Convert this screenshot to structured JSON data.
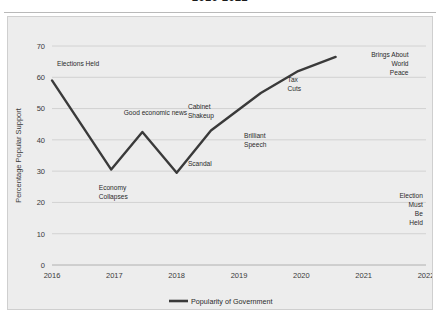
{
  "chart_title": "2016-2022",
  "chart_data": {
    "type": "line",
    "title": "2016-2022",
    "xlabel": "",
    "ylabel": "Percentage Popular Support",
    "xlim": [
      2016,
      2022
    ],
    "ylim": [
      0,
      70
    ],
    "ytick_step": 10,
    "grid": true,
    "legend_position": "bottom",
    "xtick_labels": [
      "2016",
      "2017",
      "2018",
      "2019",
      "2020",
      "2021",
      "2022"
    ],
    "ytick_labels": [
      "0",
      "10",
      "20",
      "30",
      "40",
      "50",
      "60",
      "70"
    ],
    "series": [
      {
        "name": "Popularity of Government",
        "color": "#3a3a3a",
        "x": [
          2016.0,
          2016.95,
          2017.45,
          2018.0,
          2018.55,
          2019.35,
          2019.95,
          2020.55
        ],
        "values": [
          59.0,
          30.5,
          42.5,
          29.5,
          43.0,
          55.0,
          62.0,
          66.5
        ]
      }
    ],
    "annotations": [
      {
        "text": "Elections Held",
        "lines": [
          "Elections Held"
        ],
        "x": 2016.08,
        "y": 63.5,
        "align": "start"
      },
      {
        "text": "Economy Collapses",
        "lines": [
          "Economy",
          "Collapses"
        ],
        "x": 2016.75,
        "y": 24.0,
        "align": "start"
      },
      {
        "text": "Good economic news",
        "lines": [
          "Good economic news"
        ],
        "x": 2017.15,
        "y": 48.0,
        "align": "start"
      },
      {
        "text": "Cabinet Shakeup",
        "lines": [
          "Cabinet",
          "Shakeup"
        ],
        "x": 2018.18,
        "y": 50.0,
        "align": "start"
      },
      {
        "text": "Scandal",
        "lines": [
          "Scandal"
        ],
        "x": 2018.18,
        "y": 31.5,
        "align": "start"
      },
      {
        "text": "Brilliant Speech",
        "lines": [
          "Brilliant",
          "Speech"
        ],
        "x": 2019.08,
        "y": 40.5,
        "align": "start"
      },
      {
        "text": "Tax Cuts",
        "lines": [
          "Tax",
          "Cuts"
        ],
        "x": 2019.78,
        "y": 58.5,
        "align": "start"
      },
      {
        "text": "Brings About World Peace",
        "lines": [
          "Brings About",
          "World",
          "Peace"
        ],
        "x": 2021.72,
        "y": 66.5,
        "align": "end"
      },
      {
        "text": "Election Must Be Held",
        "lines": [
          "Election",
          "Must",
          "Be",
          "Held"
        ],
        "x": 2021.95,
        "y": 21.5,
        "align": "end"
      }
    ]
  },
  "legend": {
    "entries": [
      {
        "label": "Popularity of Government",
        "color": "#3a3a3a"
      }
    ]
  }
}
